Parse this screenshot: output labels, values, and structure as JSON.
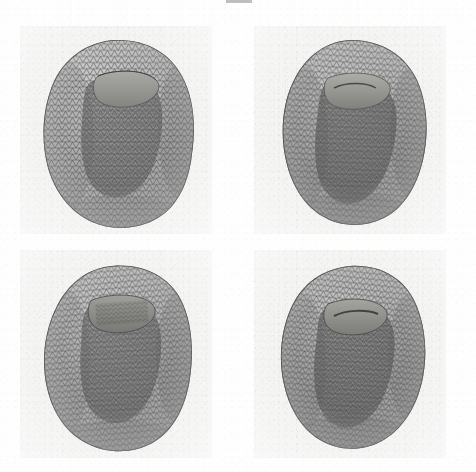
{
  "figure": {
    "title": "Four-view triangulated surface mesh rendering",
    "description": "Grayscale wireframe renderings of a triangulated anatomical surface mesh (cardiac ventricular model) shown from four viewpoints in a 2x2 grid",
    "background_color": "#ffffff",
    "panel_background_color": "#f2f2f1",
    "mesh_line_color": "#4a4a4a",
    "mesh_fill_color": "#b4b4b4",
    "cavity_color": "#8f8f8f",
    "header_fragment": "",
    "panel_count": 4,
    "columns": 2,
    "rows": 2
  },
  "panels": [
    {
      "id": "panel-top-left",
      "position": "top-left",
      "view_label": "",
      "x": 20,
      "y": 26,
      "width": 192,
      "height": 208,
      "orientation_deg": 0,
      "object": "triangulated surface mesh",
      "opening_visible": true
    },
    {
      "id": "panel-top-right",
      "position": "top-right",
      "view_label": "",
      "x": 254,
      "y": 26,
      "width": 192,
      "height": 208,
      "orientation_deg": 22,
      "object": "triangulated surface mesh",
      "opening_visible": true
    },
    {
      "id": "panel-bottom-left",
      "position": "bottom-left",
      "view_label": "",
      "x": 20,
      "y": 250,
      "width": 192,
      "height": 208,
      "orientation_deg": 44,
      "object": "triangulated surface mesh",
      "opening_visible": true
    },
    {
      "id": "panel-bottom-right",
      "position": "bottom-right",
      "view_label": "",
      "x": 254,
      "y": 250,
      "width": 192,
      "height": 208,
      "orientation_deg": 66,
      "object": "triangulated surface mesh",
      "opening_visible": true
    }
  ],
  "chart_data": {
    "type": "scatter",
    "xlabel": "",
    "ylabel": "",
    "series": [
      {
        "name": "panel-top-left",
        "values": []
      },
      {
        "name": "panel-top-right",
        "values": []
      },
      {
        "name": "panel-bottom-left",
        "values": []
      },
      {
        "name": "panel-bottom-right",
        "values": []
      }
    ]
  }
}
